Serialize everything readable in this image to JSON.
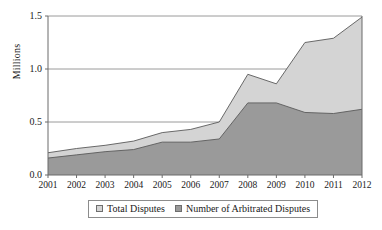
{
  "chart_data": {
    "type": "area",
    "title": "",
    "subtitle": "",
    "xlabel": "",
    "ylabel": "Millions",
    "categories": [
      "2001",
      "2002",
      "2003",
      "2004",
      "2005",
      "2006",
      "2007",
      "2008",
      "2009",
      "2010",
      "2011",
      "2012"
    ],
    "series": [
      {
        "name": "Total Disputes",
        "color": "#d4d4d4",
        "values": [
          0.21,
          0.25,
          0.28,
          0.32,
          0.4,
          0.43,
          0.5,
          0.95,
          0.86,
          1.25,
          1.29,
          1.49
        ]
      },
      {
        "name": "Number of Arbitrated Disputes",
        "color": "#9a9a9a",
        "values": [
          0.16,
          0.19,
          0.22,
          0.24,
          0.31,
          0.31,
          0.34,
          0.68,
          0.68,
          0.59,
          0.58,
          0.62
        ]
      }
    ],
    "ylim": [
      0.0,
      1.5
    ],
    "yticks": [
      "0.0",
      "0.5",
      "1.0",
      "1.5"
    ],
    "ytick_values": [
      0.0,
      0.5,
      1.0,
      1.5
    ],
    "grid": true,
    "legend_position": "bottom"
  },
  "legend": {
    "entries": [
      {
        "label": "Total Disputes",
        "swatch": "#d4d4d4"
      },
      {
        "label": "Number of Arbitrated Disputes",
        "swatch": "#9a9a9a"
      }
    ]
  }
}
